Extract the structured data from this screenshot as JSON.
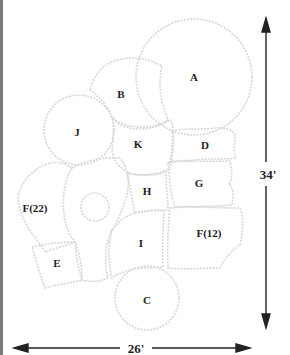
{
  "diagram": {
    "type": "garden planting plan",
    "beds": [
      {
        "id": "A",
        "label": "A",
        "shape": "circle",
        "x": 194,
        "y": 77
      },
      {
        "id": "B",
        "label": "B",
        "shape": "blob",
        "x": 121,
        "y": 94
      },
      {
        "id": "J",
        "label": "J",
        "shape": "circle",
        "x": 77,
        "y": 132
      },
      {
        "id": "K",
        "label": "K",
        "shape": "blob",
        "x": 138,
        "y": 144
      },
      {
        "id": "D",
        "label": "D",
        "shape": "rect",
        "x": 205,
        "y": 145
      },
      {
        "id": "G",
        "label": "G",
        "shape": "rect",
        "x": 199,
        "y": 183
      },
      {
        "id": "H",
        "label": "H",
        "shape": "rect",
        "x": 147,
        "y": 191
      },
      {
        "id": "F22",
        "label": "F(22)",
        "shape": "arc",
        "x": 35,
        "y": 208
      },
      {
        "id": "I",
        "label": "I",
        "shape": "blob",
        "x": 141,
        "y": 243
      },
      {
        "id": "F12",
        "label": "F(12)",
        "shape": "blob",
        "x": 209,
        "y": 233
      },
      {
        "id": "E",
        "label": "E",
        "shape": "rect",
        "x": 57,
        "y": 263
      },
      {
        "id": "C",
        "label": "C",
        "shape": "circle",
        "x": 147,
        "y": 300
      }
    ],
    "dimensions": {
      "height_label": "34'",
      "width_label": "26'"
    },
    "colors": {
      "outline": "#d8d8d8",
      "text": "#222222",
      "arrow": "#222222",
      "border": "#7a7a7a"
    }
  }
}
